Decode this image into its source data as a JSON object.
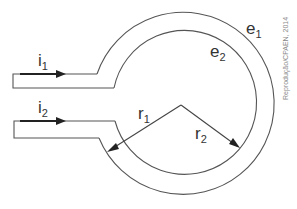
{
  "diagram": {
    "type": "circuit-loop",
    "labels": {
      "i1": {
        "base": "i",
        "sub": "1"
      },
      "i2": {
        "base": "i",
        "sub": "2"
      },
      "e1": {
        "base": "e",
        "sub": "1"
      },
      "e2": {
        "base": "e",
        "sub": "2"
      },
      "r1": {
        "base": "r",
        "sub": "1"
      },
      "r2": {
        "base": "r",
        "sub": "2"
      }
    },
    "credit": "Reprodução/CPAEN, 2014",
    "colors": {
      "line": "#555555",
      "arrow": "#222222",
      "text": "#333333",
      "credit": "#888888"
    }
  }
}
